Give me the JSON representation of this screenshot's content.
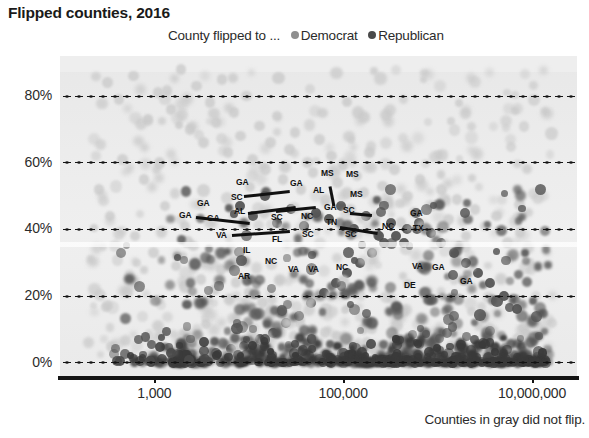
{
  "title": "Flipped counties, 2016",
  "legend": {
    "prefix": "County flipped to ...",
    "entries": [
      {
        "label": "Democrat",
        "color": "#8f8f8f"
      },
      {
        "label": "Republican",
        "color": "#4a4a4a"
      }
    ]
  },
  "footnote": "Counties in gray did not flip.",
  "colors": {
    "panel": "#ebebeb",
    "axis": "#141414",
    "grid": "#141414",
    "text": "#2b2b2b",
    "not_flipped": "#c9c9c9",
    "flipped_republican": "#4a4a4a",
    "flipped_democrat": "#8f8f8f"
  },
  "chart_data": {
    "type": "scatter",
    "title": "Flipped counties, 2016",
    "subtitle": "County flipped to ...",
    "xlabel": "",
    "ylabel": "",
    "xscale": "log",
    "xlim": [
      100,
      30000000
    ],
    "ylim": [
      -0.04,
      0.92
    ],
    "grid": true,
    "legend_position": "top",
    "xticks": [
      1000,
      100000,
      10000000
    ],
    "xticklabels": [
      "1,000",
      "100,000",
      "10,000,000"
    ],
    "yticks": [
      0,
      0.2,
      0.4,
      0.6,
      0.8
    ],
    "yticklabels": [
      "0%",
      "20%",
      "40%",
      "60%",
      "80%"
    ],
    "series": [
      {
        "name": "Did not flip",
        "color": "#c9c9c9",
        "note": "Counties in gray did not flip.",
        "points": [
          [
            320,
            0.84
          ],
          [
            420,
            0.79
          ],
          [
            600,
            0.86
          ],
          [
            850,
            0.73
          ],
          [
            1100,
            0.81
          ],
          [
            1500,
            0.76
          ],
          [
            1900,
            0.88
          ],
          [
            2400,
            0.7
          ],
          [
            2800,
            0.83
          ],
          [
            3300,
            0.66
          ],
          [
            3900,
            0.78
          ],
          [
            4500,
            0.72
          ],
          [
            5200,
            0.85
          ],
          [
            6000,
            0.63
          ],
          [
            7000,
            0.75
          ],
          [
            8200,
            0.68
          ],
          [
            9500,
            0.8
          ],
          [
            11000,
            0.61
          ],
          [
            13000,
            0.71
          ],
          [
            15000,
            0.58
          ],
          [
            17000,
            0.66
          ],
          [
            20000,
            0.74
          ],
          [
            23000,
            0.55
          ],
          [
            27000,
            0.64
          ],
          [
            31000,
            0.69
          ],
          [
            36000,
            0.52
          ],
          [
            42000,
            0.6
          ],
          [
            48000,
            0.57
          ],
          [
            56000,
            0.67
          ],
          [
            65000,
            0.49
          ],
          [
            75000,
            0.62
          ],
          [
            87000,
            0.54
          ],
          [
            100000,
            0.59
          ],
          [
            120000,
            0.46
          ],
          [
            140000,
            0.56
          ],
          [
            165000,
            0.51
          ],
          [
            190000,
            0.63
          ],
          [
            220000,
            0.44
          ],
          [
            260000,
            0.53
          ],
          [
            300000,
            0.48
          ],
          [
            350000,
            0.58
          ],
          [
            410000,
            0.42
          ],
          [
            480000,
            0.5
          ],
          [
            560000,
            0.45
          ],
          [
            650000,
            0.55
          ],
          [
            760000,
            0.4
          ],
          [
            900000,
            0.47
          ],
          [
            1100000,
            0.52
          ],
          [
            1300000,
            0.43
          ],
          [
            1600000,
            0.49
          ],
          [
            2000000,
            0.38
          ],
          [
            2500000,
            0.46
          ],
          [
            3200000,
            0.41
          ],
          [
            4200000,
            0.44
          ],
          [
            5500000,
            0.36
          ],
          [
            7500000,
            0.39
          ],
          [
            260,
            0.52
          ],
          [
            340,
            0.44
          ],
          [
            460,
            0.61
          ],
          [
            620,
            0.38
          ],
          [
            780,
            0.55
          ],
          [
            980,
            0.33
          ],
          [
            1300,
            0.47
          ],
          [
            1700,
            0.29
          ],
          [
            2100,
            0.41
          ],
          [
            2600,
            0.35
          ],
          [
            3100,
            0.25
          ],
          [
            3700,
            0.31
          ],
          [
            4400,
            0.22
          ],
          [
            5100,
            0.28
          ],
          [
            6200,
            0.19
          ],
          [
            7300,
            0.24
          ],
          [
            8600,
            0.16
          ],
          [
            10000,
            0.21
          ],
          [
            12000,
            0.14
          ],
          [
            14000,
            0.18
          ],
          [
            16500,
            0.11
          ],
          [
            19000,
            0.15
          ],
          [
            22000,
            0.09
          ],
          [
            26000,
            0.13
          ],
          [
            30000,
            0.08
          ],
          [
            35000,
            0.12
          ],
          [
            41000,
            0.07
          ],
          [
            47000,
            0.1
          ],
          [
            55000,
            0.06
          ],
          [
            64000,
            0.09
          ],
          [
            74000,
            0.05
          ],
          [
            86000,
            0.08
          ],
          [
            99000,
            0.04
          ],
          [
            115000,
            0.07
          ],
          [
            135000,
            0.05
          ],
          [
            155000,
            0.03
          ],
          [
            180000,
            0.06
          ],
          [
            210000,
            0.04
          ],
          [
            245000,
            0.02
          ],
          [
            285000,
            0.05
          ],
          [
            330000,
            0.03
          ],
          [
            390000,
            0.06
          ],
          [
            450000,
            0.02
          ],
          [
            520000,
            0.04
          ],
          [
            610000,
            0.03
          ],
          [
            710000,
            0.05
          ],
          [
            830000,
            0.02
          ],
          [
            970000,
            0.04
          ],
          [
            1150000,
            0.03
          ],
          [
            1400000,
            0.05
          ],
          [
            1700000,
            0.02
          ],
          [
            2100000,
            0.04
          ],
          [
            2600000,
            0.03
          ],
          [
            3300000,
            0.02
          ],
          [
            4100000,
            0.04
          ],
          [
            5200000,
            0.03
          ],
          [
            6800000,
            0.02
          ],
          [
            9000000,
            0.03
          ]
        ]
      },
      {
        "name": "Flipped to Republican",
        "color": "#4a4a4a",
        "points": [
          [
            400,
            0.005
          ],
          [
            700,
            0.004
          ],
          [
            1200,
            0.01
          ],
          [
            2000,
            0.012
          ],
          [
            3000,
            0.02
          ],
          [
            4500,
            0.03
          ],
          [
            6500,
            0.04
          ],
          [
            9000,
            0.05
          ],
          [
            13000,
            0.07
          ],
          [
            18000,
            0.09
          ],
          [
            25000,
            0.12
          ],
          [
            34000,
            0.14
          ],
          [
            46000,
            0.18
          ],
          [
            62000,
            0.21
          ],
          [
            84000,
            0.24
          ],
          [
            110000,
            0.27
          ],
          [
            150000,
            0.3
          ],
          [
            200000,
            0.33
          ],
          [
            270000,
            0.36
          ],
          [
            360000,
            0.38
          ],
          [
            480000,
            0.4
          ],
          [
            640000,
            0.42
          ],
          [
            850000,
            0.39
          ],
          [
            1100000,
            0.36
          ],
          [
            1500000,
            0.33
          ],
          [
            2000000,
            0.3
          ],
          [
            2700000,
            0.27
          ],
          [
            3600000,
            0.24
          ],
          [
            5000000,
            0.2
          ],
          [
            7000000,
            0.16
          ],
          [
            8000,
            0.47
          ],
          [
            11000,
            0.44
          ],
          [
            15000,
            0.5
          ],
          [
            20000,
            0.42
          ],
          [
            28000,
            0.46
          ],
          [
            38000,
            0.41
          ],
          [
            52000,
            0.45
          ],
          [
            70000,
            0.43
          ],
          [
            95000,
            0.47
          ],
          [
            130000,
            0.4
          ],
          [
            175000,
            0.44
          ],
          [
            240000,
            0.38
          ],
          [
            320000,
            0.42
          ],
          [
            440000,
            0.36
          ],
          [
            600000,
            0.4
          ]
        ]
      }
    ],
    "annotations": [
      {
        "label": "GA",
        "x": 197,
        "y": 199
      },
      {
        "label": "GA",
        "x": 207,
        "y": 214
      },
      {
        "label": "SC",
        "x": 231,
        "y": 193
      },
      {
        "label": "GA",
        "x": 236,
        "y": 178
      },
      {
        "label": "AL",
        "x": 234,
        "y": 207
      },
      {
        "label": "GA",
        "x": 179,
        "y": 211
      },
      {
        "label": "SC",
        "x": 271,
        "y": 213
      },
      {
        "label": "VA",
        "x": 216,
        "y": 231
      },
      {
        "label": "GA",
        "x": 290,
        "y": 179
      },
      {
        "label": "AL",
        "x": 313,
        "y": 186
      },
      {
        "label": "MS",
        "x": 321,
        "y": 169
      },
      {
        "label": "MS",
        "x": 346,
        "y": 170
      },
      {
        "label": "MS",
        "x": 350,
        "y": 190
      },
      {
        "label": "GA",
        "x": 324,
        "y": 203
      },
      {
        "label": "NC",
        "x": 301,
        "y": 212
      },
      {
        "label": "TN",
        "x": 326,
        "y": 218
      },
      {
        "label": "SC",
        "x": 343,
        "y": 206
      },
      {
        "label": "SC",
        "x": 345,
        "y": 230
      },
      {
        "label": "NC",
        "x": 382,
        "y": 222
      },
      {
        "label": "GA",
        "x": 410,
        "y": 209
      },
      {
        "label": "TX",
        "x": 413,
        "y": 224
      },
      {
        "label": "FL",
        "x": 272,
        "y": 235
      },
      {
        "label": "SC",
        "x": 302,
        "y": 230
      },
      {
        "label": "IL",
        "x": 243,
        "y": 246
      },
      {
        "label": "NC",
        "x": 265,
        "y": 257
      },
      {
        "label": "VA",
        "x": 288,
        "y": 265
      },
      {
        "label": "VA",
        "x": 308,
        "y": 265
      },
      {
        "label": "NC",
        "x": 336,
        "y": 263
      },
      {
        "label": "AR",
        "x": 238,
        "y": 272
      },
      {
        "label": "VA",
        "x": 412,
        "y": 262
      },
      {
        "label": "DE",
        "x": 404,
        "y": 281
      },
      {
        "label": "GA",
        "x": 432,
        "y": 263
      },
      {
        "label": "GA",
        "x": 460,
        "y": 277
      }
    ]
  }
}
